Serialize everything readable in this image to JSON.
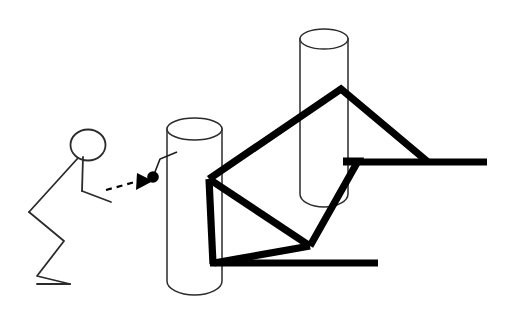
{
  "canvas": {
    "width": 512,
    "height": 324,
    "background": "#ffffff"
  },
  "style": {
    "ink": "#000000",
    "thin_ink": "#2b2b2b",
    "thick_stroke_width": 7.2,
    "thin_stroke_width": 1.6,
    "dash_pattern": "6 5"
  },
  "scene": {
    "title": "Stick figure pushing a ball toward a cylinder with angular line structure",
    "elements": [
      "stick-figure",
      "dashed-motion-arrow",
      "pendulum-ball",
      "left-cylinder",
      "right-cylinder",
      "thick-polyline-structure"
    ]
  },
  "figure": {
    "head": {
      "cx": 88,
      "cy": 145,
      "rx": 17.5,
      "ry": 15.5
    },
    "neck_to_back": "M 78,158 L 29,212",
    "legs": "M 29,212 L 64,241 L 37,276 L 70,284",
    "foot": "M 37,284 L 70,284",
    "torso": "M 83,157 L 82,191",
    "arm": "M 82,191 L 111,202"
  },
  "arrow": {
    "line": "M 106,190 L 136,182",
    "head_points": "137,174 152,181 136,189",
    "direction": "right"
  },
  "ball": {
    "cx": 153,
    "cy": 177,
    "r": 5.6
  },
  "string": "M 153,177 L 159,160 L 176,153",
  "cylinders": [
    {
      "name": "left-cylinder",
      "left": 167,
      "right": 222,
      "top": 118,
      "bottom": 292,
      "ellipse_ry": 11
    },
    {
      "name": "right-cylinder",
      "left": 300,
      "right": 348,
      "top": 29,
      "bottom": 205,
      "ellipse_ry": 10
    }
  ],
  "polyline": {
    "upper_chevron": "M 209,179 L 341,89 L 427,162",
    "upper_bar": "M 345,162 L 486,162",
    "lower_chevron": "M 209,179 L 311,245 L 356,161 L 345,161",
    "lower_diagonal": "M 311,245 L 214,263",
    "lower_bar": "M 211,263 L 377,263",
    "diag_to_bottom": "M 209,179 L 213,263"
  }
}
